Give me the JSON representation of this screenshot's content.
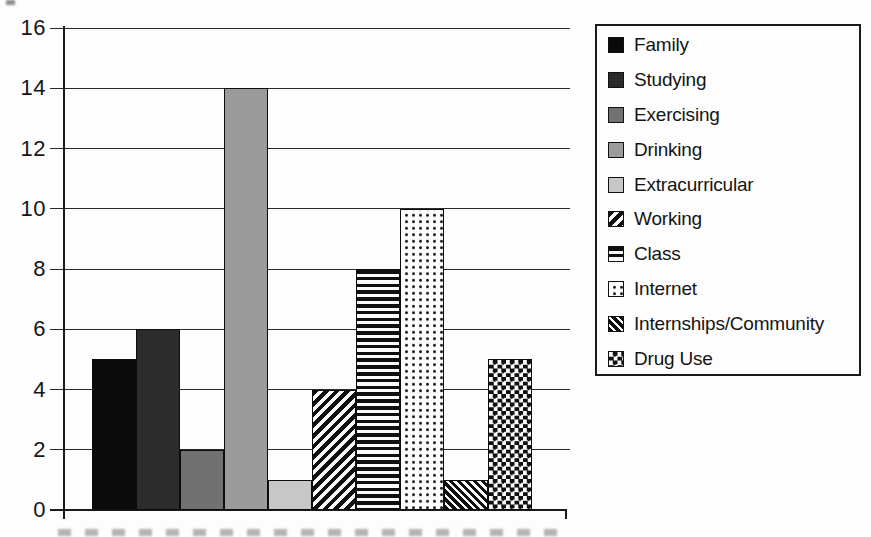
{
  "chart_data": {
    "type": "bar",
    "categories": [
      "Family",
      "Studying",
      "Exercising",
      "Drinking",
      "Extracurricular",
      "Working",
      "Class",
      "Internet",
      "Internships/Community",
      "Drug Use"
    ],
    "values": [
      5,
      6,
      2,
      14,
      1,
      4,
      8,
      10,
      1,
      5
    ],
    "ylim": [
      0,
      16
    ],
    "yticks": [
      0,
      2,
      4,
      6,
      8,
      10,
      12,
      14,
      16
    ],
    "grid": true,
    "legend_position": "right",
    "legend": [
      {
        "label": "Family",
        "pattern": "solid",
        "color": "#0b0b0b"
      },
      {
        "label": "Studying",
        "pattern": "solid",
        "color": "#2c2c2c"
      },
      {
        "label": "Exercising",
        "pattern": "solid",
        "color": "#717171"
      },
      {
        "label": "Drinking",
        "pattern": "solid",
        "color": "#9b9b9b"
      },
      {
        "label": "Extracurricular",
        "pattern": "solid",
        "color": "#c7c7c7"
      },
      {
        "label": "Working",
        "pattern": "diagonal-up",
        "color": "#101010"
      },
      {
        "label": "Class",
        "pattern": "horizontal-lines",
        "color": "#101010"
      },
      {
        "label": "Internet",
        "pattern": "dots",
        "color": "#101010"
      },
      {
        "label": "Internships/Community",
        "pattern": "diagonal-down",
        "color": "#101010"
      },
      {
        "label": "Drug Use",
        "pattern": "checkerboard",
        "color": "#101010"
      }
    ],
    "colors": {
      "axis": "#1a1a1a",
      "gridline": "#2a2a2a",
      "background": "#fdfdfd",
      "pattern_foreground": "#101010",
      "pattern_background": "#fafafa"
    }
  }
}
